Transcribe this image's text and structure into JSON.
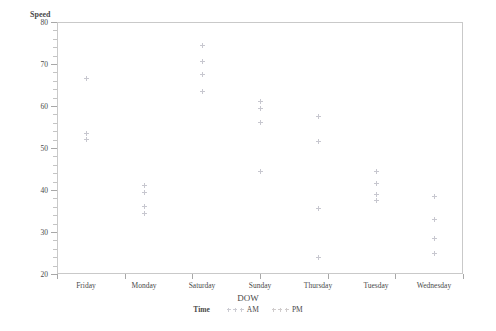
{
  "chart_data": {
    "type": "scatter",
    "title": "",
    "xlabel": "DOW",
    "ylabel": "Speed",
    "categories": [
      "Friday",
      "Monday",
      "Saturday",
      "Sunday",
      "Thursday",
      "Tuesday",
      "Wednesday"
    ],
    "ylim": [
      20,
      80
    ],
    "yticks": [
      20,
      30,
      40,
      50,
      60,
      70,
      80
    ],
    "ytick_labels": [
      "20",
      "30",
      "40",
      "50",
      "60",
      "70",
      "80"
    ],
    "y_minor_step": 2,
    "grid": false,
    "legend": {
      "title": "Time",
      "position": "bottom",
      "entries": [
        {
          "label": "AM",
          "marker": "plus",
          "color": "#9a9aa8"
        },
        {
          "label": "PM",
          "marker": "plus",
          "color": "#a39a9a"
        }
      ]
    },
    "series": [
      {
        "name": "AM",
        "color": "#9a9aa8",
        "points": [
          {
            "x": "Friday",
            "y": 66.5
          },
          {
            "x": "Friday",
            "y": 53.5
          },
          {
            "x": "Friday",
            "y": 52.0
          },
          {
            "x": "Monday",
            "y": 41.0
          },
          {
            "x": "Monday",
            "y": 39.5
          },
          {
            "x": "Monday",
            "y": 36.0
          },
          {
            "x": "Monday",
            "y": 34.5
          },
          {
            "x": "Saturday",
            "y": 74.5
          },
          {
            "x": "Saturday",
            "y": 70.5
          },
          {
            "x": "Saturday",
            "y": 67.5
          },
          {
            "x": "Saturday",
            "y": 63.5
          },
          {
            "x": "Sunday",
            "y": 61.0
          },
          {
            "x": "Sunday",
            "y": 59.5
          },
          {
            "x": "Sunday",
            "y": 56.0
          },
          {
            "x": "Sunday",
            "y": 44.5
          },
          {
            "x": "Thursday",
            "y": 57.5
          },
          {
            "x": "Thursday",
            "y": 51.5
          },
          {
            "x": "Thursday",
            "y": 35.5
          },
          {
            "x": "Thursday",
            "y": 24.0
          },
          {
            "x": "Tuesday",
            "y": 44.5
          },
          {
            "x": "Tuesday",
            "y": 41.5
          },
          {
            "x": "Tuesday",
            "y": 39.0
          },
          {
            "x": "Tuesday",
            "y": 37.5
          },
          {
            "x": "Wednesday",
            "y": 38.5
          },
          {
            "x": "Wednesday",
            "y": 33.0
          },
          {
            "x": "Wednesday",
            "y": 28.5
          },
          {
            "x": "Wednesday",
            "y": 25.0
          }
        ]
      }
    ]
  }
}
